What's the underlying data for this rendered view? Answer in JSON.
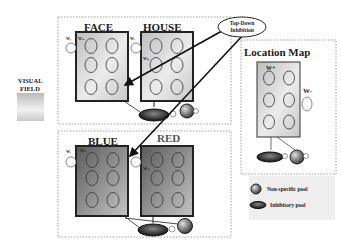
{
  "visual_field": {
    "line1": "VISUAL",
    "line2": "FIELD"
  },
  "top_down": {
    "line1": "Top-Down",
    "line2": "Inhibition"
  },
  "modules": {
    "face": {
      "title": "FACE"
    },
    "house": {
      "title": "HOUSE"
    },
    "blue": {
      "title": "BLUE"
    },
    "red": {
      "title": "RED"
    },
    "location": {
      "title": "Location Map"
    }
  },
  "weights": {
    "w_plus": "W+",
    "w_minus": "W-"
  },
  "legend": {
    "nonspecific": "Non-specific pool",
    "inhibitory": "Inhibitory pool"
  },
  "colors": {
    "object_pool_fill": "#d8d8d8",
    "color_pool_fill": "#8a8a8a",
    "border": "#222222"
  }
}
